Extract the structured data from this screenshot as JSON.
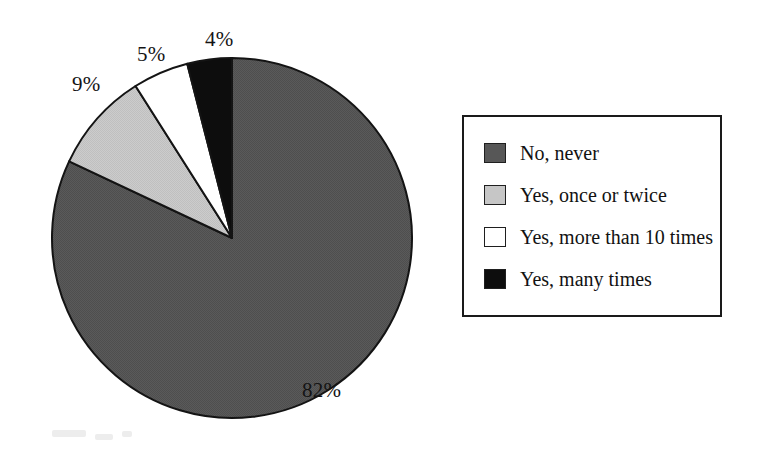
{
  "chart_data": {
    "type": "pie",
    "title": "",
    "subtitle": "",
    "xlabel": "",
    "ylabel": "",
    "legend_position": "right",
    "grid": false,
    "start_angle_deg": 0,
    "direction": "clockwise",
    "categories": [
      "No, never",
      "Yes, once or twice",
      "Yes, more than 10 times",
      "Yes, many times"
    ],
    "values": [
      82,
      9,
      5,
      4
    ],
    "value_unit": "%",
    "data_labels": [
      "82%",
      "9%",
      "5%",
      "4%"
    ],
    "slice_colors": [
      "#575757",
      "#c6c6c6",
      "#ffffff",
      "#0d0d0d"
    ],
    "slice_outline_color": "#141414"
  },
  "pie": {
    "center_x": 232,
    "center_y": 238,
    "radius": 180,
    "labels": [
      {
        "text": "82%",
        "slice": "No, never"
      },
      {
        "text": "9%",
        "slice": "Yes, once or twice"
      },
      {
        "text": "5%",
        "slice": "Yes, more than 10 times"
      },
      {
        "text": "4%",
        "slice": "Yes, many times"
      }
    ]
  },
  "legend": {
    "items": [
      {
        "label": "No, never",
        "color": "#575757"
      },
      {
        "label": "Yes, once or twice",
        "color": "#c6c6c6"
      },
      {
        "label": "Yes, more than 10 times",
        "color": "#ffffff"
      },
      {
        "label": "Yes, many times",
        "color": "#0d0d0d"
      }
    ]
  }
}
